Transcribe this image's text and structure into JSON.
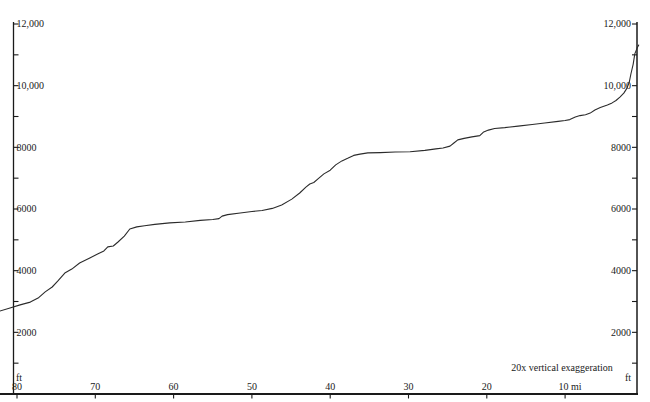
{
  "chart_data": {
    "type": "line",
    "title": "",
    "annotation": "20x vertical exaggeration",
    "grid": false,
    "legend": "none",
    "colors": {
      "background": "#ffffff",
      "axis": "#1a1a1a",
      "curve": "#2b2b2b"
    },
    "x_axis": {
      "unit": "mi",
      "direction": "values-decrease-to-right",
      "xlim": [
        82.5,
        0.5
      ],
      "tick_values": [
        80,
        70,
        60,
        50,
        40,
        30,
        20,
        10
      ],
      "tick_labels": [
        "80",
        "70",
        "60",
        "50",
        "40",
        "30",
        "20",
        "10 mi"
      ]
    },
    "y_axis": {
      "unit_left": "ft",
      "unit_right": "ft",
      "ylim": [
        0,
        12000
      ],
      "tick_step": 1000,
      "tick_min": 1000,
      "tick_max": 12000,
      "tick_labels": {
        "2000": "2000",
        "4000": "4000",
        "6000": "6000",
        "8000": "8000",
        "10000": "10,000",
        "12000": "12,000"
      }
    },
    "series": [
      {
        "name": "elevation-profile",
        "x_unit": "mi",
        "y_unit": "ft",
        "points": [
          [
            82.2,
            2690
          ],
          [
            80.9,
            2790
          ],
          [
            79.6,
            2890
          ],
          [
            78.3,
            2980
          ],
          [
            77.3,
            3110
          ],
          [
            76.4,
            3310
          ],
          [
            75.5,
            3470
          ],
          [
            74.8,
            3660
          ],
          [
            73.9,
            3920
          ],
          [
            73.0,
            4050
          ],
          [
            72.0,
            4250
          ],
          [
            70.7,
            4410
          ],
          [
            69.7,
            4540
          ],
          [
            68.9,
            4640
          ],
          [
            68.4,
            4770
          ],
          [
            67.7,
            4800
          ],
          [
            67.1,
            4930
          ],
          [
            66.3,
            5120
          ],
          [
            65.6,
            5350
          ],
          [
            64.7,
            5420
          ],
          [
            63.7,
            5460
          ],
          [
            62.4,
            5500
          ],
          [
            60.5,
            5550
          ],
          [
            58.5,
            5580
          ],
          [
            56.6,
            5630
          ],
          [
            55.0,
            5660
          ],
          [
            54.2,
            5690
          ],
          [
            53.8,
            5770
          ],
          [
            53.1,
            5820
          ],
          [
            51.5,
            5870
          ],
          [
            50.0,
            5920
          ],
          [
            48.7,
            5950
          ],
          [
            47.4,
            6020
          ],
          [
            46.2,
            6130
          ],
          [
            44.9,
            6320
          ],
          [
            43.9,
            6520
          ],
          [
            43.1,
            6710
          ],
          [
            42.6,
            6810
          ],
          [
            42.1,
            6860
          ],
          [
            41.6,
            6970
          ],
          [
            40.8,
            7140
          ],
          [
            40.0,
            7260
          ],
          [
            39.3,
            7430
          ],
          [
            38.5,
            7560
          ],
          [
            37.7,
            7650
          ],
          [
            37.0,
            7740
          ],
          [
            36.2,
            7780
          ],
          [
            35.2,
            7820
          ],
          [
            33.6,
            7830
          ],
          [
            31.7,
            7850
          ],
          [
            29.8,
            7860
          ],
          [
            27.9,
            7900
          ],
          [
            26.5,
            7950
          ],
          [
            25.6,
            7980
          ],
          [
            24.7,
            8040
          ],
          [
            24.2,
            8140
          ],
          [
            23.7,
            8240
          ],
          [
            22.9,
            8290
          ],
          [
            21.9,
            8340
          ],
          [
            20.9,
            8380
          ],
          [
            20.4,
            8500
          ],
          [
            19.8,
            8560
          ],
          [
            19.0,
            8610
          ],
          [
            17.7,
            8640
          ],
          [
            16.0,
            8690
          ],
          [
            14.2,
            8740
          ],
          [
            12.6,
            8790
          ],
          [
            10.9,
            8840
          ],
          [
            10.0,
            8870
          ],
          [
            9.4,
            8900
          ],
          [
            8.7,
            8980
          ],
          [
            8.1,
            9030
          ],
          [
            7.4,
            9060
          ],
          [
            6.8,
            9110
          ],
          [
            6.2,
            9210
          ],
          [
            5.5,
            9290
          ],
          [
            4.6,
            9370
          ],
          [
            4.0,
            9440
          ],
          [
            3.5,
            9520
          ],
          [
            3.0,
            9630
          ],
          [
            2.5,
            9760
          ],
          [
            2.1,
            9920
          ],
          [
            1.8,
            10120
          ],
          [
            1.6,
            10380
          ],
          [
            1.3,
            10700
          ],
          [
            1.1,
            11030
          ],
          [
            0.8,
            11220
          ],
          [
            0.6,
            11320
          ]
        ]
      }
    ]
  }
}
